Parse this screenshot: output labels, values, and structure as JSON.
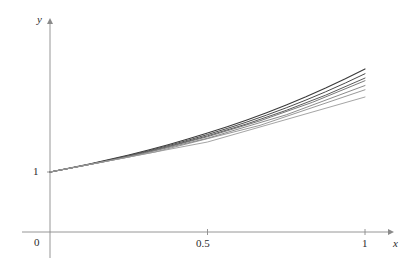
{
  "figure": {
    "background_color": "#ffffff",
    "axis_color": "#8a8a8a",
    "text_color": "#2b2b2b"
  },
  "axes": {
    "y_axis_label": "y",
    "x_axis_label": "x",
    "origin_label": "0",
    "x_ticks": [
      "0.5",
      "1"
    ],
    "y_ticks": [
      "1"
    ]
  },
  "chart_data": {
    "type": "line",
    "title": "",
    "xlabel": "x",
    "ylabel": "y",
    "xlim": [
      0,
      1.08
    ],
    "ylim": [
      0,
      3.0
    ],
    "xticks": [
      0,
      0.5,
      1
    ],
    "xticklabels": [
      "0",
      "0.5",
      "1"
    ],
    "yticks": [
      1
    ],
    "yticklabels": [
      "1"
    ],
    "grid": false,
    "legend": "none",
    "annotations": [],
    "series": [
      {
        "name": "exact",
        "color": "#3a3a3a",
        "width": 1.1,
        "x": [
          0,
          0.0625,
          0.125,
          0.1875,
          0.25,
          0.3125,
          0.375,
          0.4375,
          0.5,
          0.5625,
          0.625,
          0.6875,
          0.75,
          0.8125,
          0.875,
          0.9375,
          1
        ],
        "y": [
          1,
          1.0645,
          1.1331,
          1.2062,
          1.284,
          1.3668,
          1.455,
          1.5488,
          1.6487,
          1.7551,
          1.8682,
          1.9887,
          2.117,
          2.2535,
          2.3989,
          2.5536,
          2.7183
        ]
      },
      {
        "name": "n16",
        "color": "#4a4a4a",
        "width": 1.0,
        "x": [
          0,
          0.0625,
          0.125,
          0.1875,
          0.25,
          0.3125,
          0.375,
          0.4375,
          0.5,
          0.5625,
          0.625,
          0.6875,
          0.75,
          0.8125,
          0.875,
          0.9375,
          1
        ],
        "y": [
          1,
          1.0625,
          1.1289,
          1.1995,
          1.2744,
          1.3541,
          1.4387,
          1.5286,
          1.6242,
          1.7257,
          1.8335,
          1.9481,
          2.0699,
          2.1993,
          2.3368,
          2.4828,
          2.638
        ]
      },
      {
        "name": "n8",
        "color": "#5a5a5a",
        "width": 1.0,
        "x": [
          0,
          0.125,
          0.25,
          0.375,
          0.5,
          0.625,
          0.75,
          0.875,
          1
        ],
        "y": [
          1,
          1.125,
          1.2656,
          1.4238,
          1.6018,
          1.802,
          2.0273,
          2.2807,
          2.5658
        ]
      },
      {
        "name": "n6",
        "color": "#6b6b6b",
        "width": 0.9,
        "x": [
          0,
          0.1667,
          0.3333,
          0.5,
          0.6667,
          0.8333,
          1
        ],
        "y": [
          1,
          1.1667,
          1.3611,
          1.588,
          1.8527,
          2.1615,
          2.5216
        ]
      },
      {
        "name": "n4",
        "color": "#7d7d7d",
        "width": 0.9,
        "x": [
          0,
          0.25,
          0.5,
          0.75,
          1
        ],
        "y": [
          1,
          1.25,
          1.5625,
          1.9531,
          2.4414
        ]
      },
      {
        "name": "n3",
        "color": "#8d8d8d",
        "width": 0.9,
        "x": [
          0,
          0.3333,
          0.6667,
          1
        ],
        "y": [
          1,
          1.3333,
          1.7778,
          2.3704
        ]
      },
      {
        "name": "n2",
        "color": "#9a9a9a",
        "width": 0.9,
        "x": [
          0,
          0.5,
          1
        ],
        "y": [
          1,
          1.5,
          2.25
        ]
      }
    ]
  }
}
